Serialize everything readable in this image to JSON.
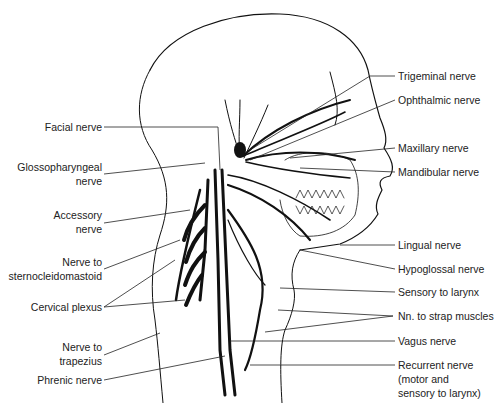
{
  "diagram": {
    "left_labels": [
      {
        "id": "facial",
        "lines": [
          "Facial nerve"
        ]
      },
      {
        "id": "glossopharyngeal",
        "lines": [
          "Glossopharyngeal",
          "nerve"
        ]
      },
      {
        "id": "accessory",
        "lines": [
          "Accessory",
          "nerve"
        ]
      },
      {
        "id": "sternocleidomastoid",
        "lines": [
          "Nerve to",
          "sternocleidomastoid"
        ]
      },
      {
        "id": "cervical-plexus",
        "lines": [
          "Cervical plexus"
        ]
      },
      {
        "id": "trapezius",
        "lines": [
          "Nerve to",
          "trapezius"
        ]
      },
      {
        "id": "phrenic",
        "lines": [
          "Phrenic nerve"
        ]
      }
    ],
    "right_labels": [
      {
        "id": "trigeminal",
        "lines": [
          "Trigeminal nerve"
        ]
      },
      {
        "id": "ophthalmic",
        "lines": [
          "Ophthalmic nerve"
        ]
      },
      {
        "id": "maxillary",
        "lines": [
          "Maxillary nerve"
        ]
      },
      {
        "id": "mandibular",
        "lines": [
          "Mandibular nerve"
        ]
      },
      {
        "id": "lingual",
        "lines": [
          "Lingual nerve"
        ]
      },
      {
        "id": "hypoglossal",
        "lines": [
          "Hypoglossal nerve"
        ]
      },
      {
        "id": "sensory-larynx",
        "lines": [
          "Sensory to larynx"
        ]
      },
      {
        "id": "strap-muscles",
        "lines": [
          "Nn. to strap muscles"
        ]
      },
      {
        "id": "vagus",
        "lines": [
          "Vagus nerve"
        ]
      },
      {
        "id": "recurrent",
        "lines": [
          "Recurrent nerve",
          "(motor and",
          "sensory to larynx)"
        ]
      }
    ],
    "colors": {
      "ink": "#111111",
      "text": "#222222",
      "background": "#ffffff"
    }
  }
}
